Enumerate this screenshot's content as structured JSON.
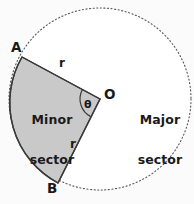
{
  "figure": {
    "type": "geometry-diagram",
    "background_color": "#fbfbfb",
    "circle": {
      "center_label": "O",
      "center_x": 100,
      "center_y": 99,
      "radius": 91,
      "outline_style": "dotted",
      "outline_color": "#555555",
      "fill_color": "#ffffff"
    },
    "minor_sector": {
      "label_line1": "Minor",
      "label_line2": "sector",
      "fill_color": "#c9c9c9",
      "edge_color": "#3a3a3a",
      "arc_style": "solid",
      "start_point_label": "A",
      "end_point_label": "B"
    },
    "major_sector": {
      "label_line1": "Major",
      "label_line2": "sector",
      "fill_color": "#ffffff",
      "arc_style": "dotted"
    },
    "points": [
      {
        "name": "A",
        "label": "A",
        "x": 22,
        "y": 57
      },
      {
        "name": "B",
        "label": "B",
        "x": 58,
        "y": 183
      },
      {
        "name": "O",
        "label": "O",
        "x": 100,
        "y": 99
      }
    ],
    "radii_labels": [
      {
        "name": "radius-OA",
        "label": "r"
      },
      {
        "name": "radius-OB",
        "label": "r"
      }
    ],
    "angle": {
      "label": "θ",
      "vertex": "O",
      "between": "OA and OB",
      "marker_style": "arc"
    }
  }
}
